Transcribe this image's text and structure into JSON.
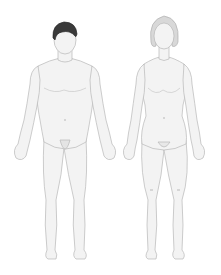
{
  "image": {
    "description": "Front-view anatomical outline illustration of a male and a female human figure",
    "background": "#ffffff",
    "skin_fill": "#f3f3f3",
    "outline_color": "#b8b8b8",
    "shade_color": "#dcdcdc",
    "male_hair_color": "#3a3a3a",
    "female_hair_color": "#d8d8d8",
    "figures": [
      {
        "name": "male",
        "position": "left",
        "view": "front"
      },
      {
        "name": "female",
        "position": "right",
        "view": "front"
      }
    ]
  }
}
